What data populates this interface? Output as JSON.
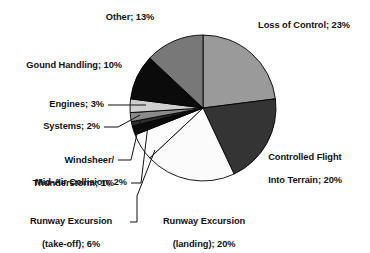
{
  "chart_data": {
    "type": "pie",
    "title": "",
    "subtitle": "",
    "xlabel": "",
    "ylabel": "",
    "legend_position": "none",
    "grid": false,
    "value_unit": "%",
    "start_angle_deg": 0,
    "direction": "clockwise",
    "categories": [
      "Loss of Control",
      "Controlled Flight Into Terrain",
      "Runway Excursion (landing)",
      "Runway Excursion (take-off)",
      "Mid-Air Collision",
      "Windsheer/Thunderstorm",
      "Systems",
      "Engines",
      "Gound Handling",
      "Other"
    ],
    "values": [
      23,
      20,
      20,
      6,
      2,
      1,
      2,
      3,
      10,
      13
    ],
    "colors": [
      "#9a9a9a",
      "#343434",
      "#fbfbfb",
      "#fdfdfd",
      "#0b0b0b",
      "#2e2e2e",
      "#8a8a8a",
      "#cfcfcf",
      "#0b0b0b",
      "#787878"
    ],
    "slice_outline_color": "#000000",
    "labels": [
      "Loss of Control; 23%",
      "Controlled Flight Into Terrain; 20%",
      "Runway Excursion (landing); 20%",
      "Runway Excursion (take-off); 6%",
      "Mid-Air Collision; 2%",
      "Windsheer/Thunderstorm; 1%",
      "Systems; 2%",
      "Engines; 3%",
      "Gound Handling; 10%",
      "Other; 13%"
    ]
  },
  "labels": {
    "other": "Other; 13%",
    "ground_handling": "Gound Handling; 10%",
    "engines": "Engines; 3%",
    "systems": "Systems; 2%",
    "windsheer_line1": "Windsheer/",
    "windsheer_line2": "Thunderstorm; 1%",
    "midair": "Mid-Air Collision; 2%",
    "runway_takeoff_line1": "Runway Excursion",
    "runway_takeoff_line2": "(take-off); 6%",
    "runway_landing_line1": "Runway Excursion",
    "runway_landing_line2": "(landing); 20%",
    "loss_of_control": "Loss of Control; 23%",
    "cfit_line1": "Controlled Flight",
    "cfit_line2": "Into Terrain; 20%"
  }
}
